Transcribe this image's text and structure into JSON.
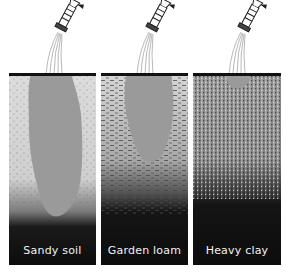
{
  "panels": [
    {
      "id": "sandy",
      "label": "Sandy soil",
      "texture": "sparse dots",
      "wet_zone": "deep narrow plume"
    },
    {
      "id": "loam",
      "label": "Garden loam",
      "texture": "dashes",
      "wet_zone": "medium teardrop plume"
    },
    {
      "id": "clay",
      "label": "Heavy clay",
      "texture": "dense speckle",
      "wet_zone": "shallow small bowl"
    }
  ],
  "colors": {
    "background": "#ffffff",
    "soil_light": "#d8d8d8",
    "wet_zone": "#9a9a9a",
    "soil_dark": "#111111",
    "surface_line": "#111111",
    "label_text": "#f2f2f2"
  },
  "icons": {
    "sprinkler": "watering-hose-nozzle-icon"
  }
}
